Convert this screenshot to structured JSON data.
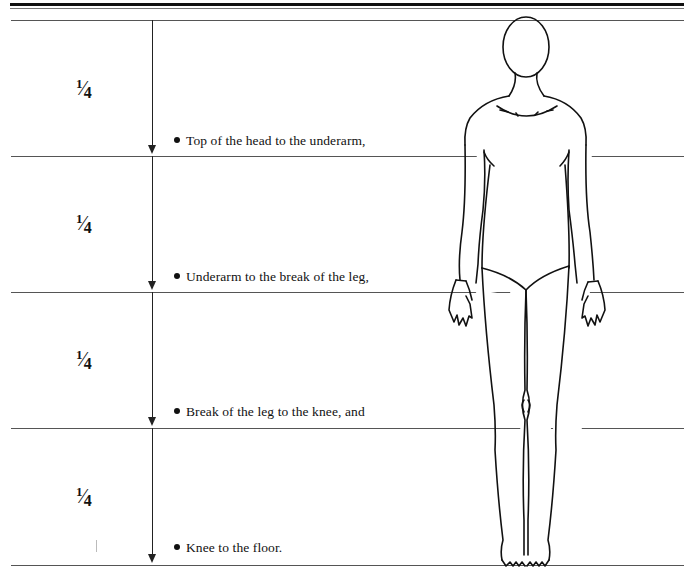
{
  "diagram": {
    "sections": [
      {
        "fraction": {
          "numerator": "1",
          "denominator": "4"
        },
        "label": "Top of the head to the underarm,"
      },
      {
        "fraction": {
          "numerator": "1",
          "denominator": "4"
        },
        "label": "Underarm to the break of the leg,"
      },
      {
        "fraction": {
          "numerator": "1",
          "denominator": "4"
        },
        "label": "Break of the leg to the knee, and"
      },
      {
        "fraction": {
          "numerator": "1",
          "denominator": "4"
        },
        "label": "Knee to the floor."
      }
    ],
    "figure": {
      "description": "Front-view line drawing of a female figure in a long-sleeved leotard"
    },
    "colors": {
      "ink": "#111111",
      "rule": "#555555",
      "background": "#ffffff"
    }
  }
}
